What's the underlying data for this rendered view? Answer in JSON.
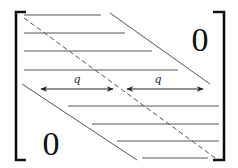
{
  "diagram": {
    "type": "banded-matrix",
    "colors": {
      "bracket": "#111111",
      "line": "#555555",
      "dashed": "#555555",
      "arrow": "#222222"
    },
    "labels": {
      "upper_right_zero": "0",
      "lower_left_zero": "0",
      "left_width": "q",
      "right_width": "q"
    }
  }
}
